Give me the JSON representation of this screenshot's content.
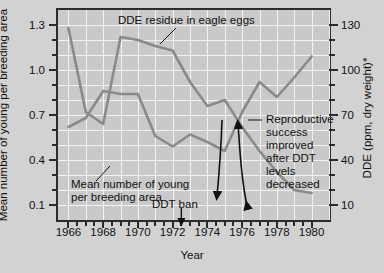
{
  "chart_data": {
    "type": "line",
    "title": "",
    "xlabel": "Year",
    "ylabel_left": "Mean number of young per breeding area",
    "ylabel_right": "DDE (ppm, dry weight)*",
    "xlim": [
      1965.4,
      1981.0
    ],
    "xticks": [
      1966,
      1968,
      1970,
      1972,
      1974,
      1976,
      1978,
      1980
    ],
    "xminor_step": 0.5,
    "ylim_left": [
      0.0,
      1.4
    ],
    "yticks_left": [
      0.1,
      0.4,
      0.7,
      1.0,
      1.3
    ],
    "yminor_step_left": 0.1,
    "ylim_right": [
      0.0,
      140.0
    ],
    "yticks_right": [
      10,
      40,
      70,
      100,
      130
    ],
    "yminor_step_right": 10,
    "grid": true,
    "legend_position": "inline-annotations",
    "series": [
      {
        "name": "DDE residue in eagle eggs",
        "axis": "right",
        "x": [
          1966,
          1967,
          1968,
          1969,
          1970,
          1971,
          1972,
          1973,
          1974,
          1975,
          1976,
          1977,
          1978,
          1979,
          1980
        ],
        "values": [
          128,
          72,
          64,
          122,
          120,
          116,
          113,
          92,
          76,
          80,
          62,
          46,
          32,
          20,
          18
        ]
      },
      {
        "name": "Mean number of young per breeding area",
        "axis": "left",
        "x": [
          1966,
          1967,
          1968,
          1969,
          1970,
          1971,
          1972,
          1973,
          1974,
          1975,
          1976,
          1977,
          1978,
          1979,
          1980
        ],
        "values": [
          0.62,
          0.68,
          0.86,
          0.84,
          0.84,
          0.56,
          0.49,
          0.57,
          0.52,
          0.46,
          0.72,
          0.92,
          0.82,
          0.95,
          1.09
        ]
      }
    ],
    "annotations": [
      {
        "name": "dde-label",
        "text": "DDE residue in eagle eggs"
      },
      {
        "name": "mean-label",
        "text": "Mean number of young\nper breeding area"
      },
      {
        "name": "ddt-ban-label",
        "text": "DDT ban",
        "x": 1972.5
      },
      {
        "name": "reproductive-note",
        "text": "Reproductive success improved after DDT levels decreased"
      }
    ]
  },
  "labels": {
    "y_left_title": "Mean number of young per breeding area",
    "y_right_title": "DDE (ppm, dry weight)*",
    "x_title": "Year",
    "y_left_ticks": [
      "1.3",
      "1.0",
      "0.7",
      "0.4",
      "0.1"
    ],
    "y_right_ticks": [
      "130",
      "100",
      "70",
      "40",
      "10"
    ],
    "x_ticks": [
      "1966",
      "1968",
      "1970",
      "1972",
      "1974",
      "1976",
      "1978",
      "1980"
    ]
  },
  "annotations": {
    "dde_series": "DDE residue in eagle eggs",
    "mean_series_line1": "Mean number of young",
    "mean_series_line2": "per breeding area",
    "ddt_ban": "DDT ban",
    "repro_line1": "Reproductive",
    "repro_line2": "success",
    "repro_line3": "improved",
    "repro_line4": "after DDT",
    "repro_line5": "levels",
    "repro_line6": "decreased"
  },
  "colors": {
    "background": "#d2d2d2",
    "plot_background": "#c9c9c9",
    "grid": "#f2f2f2",
    "axis": "#2b2b2b",
    "line": "#8a8a8a",
    "text": "#111111"
  }
}
